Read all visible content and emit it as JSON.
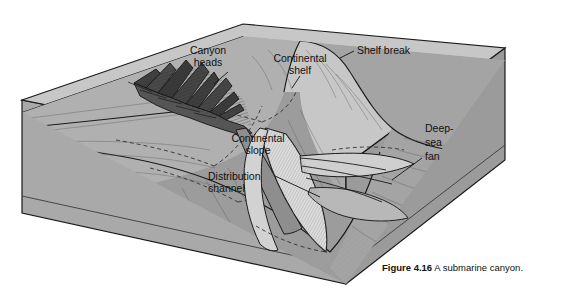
{
  "figure": {
    "caption_number": "Figure 4.16",
    "caption_text": "A submarine canyon.",
    "title": "A submarine canyon"
  },
  "labels": {
    "canyon_heads_line1": "Canyon",
    "canyon_heads_line2": "heads",
    "continental_shelf_line1": "Continental",
    "continental_shelf_line2": "shelf",
    "shelf_break": "Shelf break",
    "continental_slope_line1": "Continental",
    "continental_slope_line2": "slope",
    "distribution_channel_line1": "Distribution",
    "distribution_channel_line2": "channel",
    "deep_sea_fan_line1": "Deep-",
    "deep_sea_fan_line2": "sea",
    "deep_sea_fan_line3": "fan"
  },
  "colors": {
    "water_plane": "#c9c9c9",
    "block_left_face": "#a9a9a9",
    "block_right_face": "#9a9a9a",
    "seafloor_shelf": "#aeaeae",
    "seafloor_slope": "#9f9f9f",
    "deep_floor": "#a3a3a3",
    "canyon_dark": "#4a4a4a",
    "fan_light": "#d8d8d8",
    "outline": "#1a1a1a",
    "background": "#ffffff",
    "label_text": "#111111"
  }
}
